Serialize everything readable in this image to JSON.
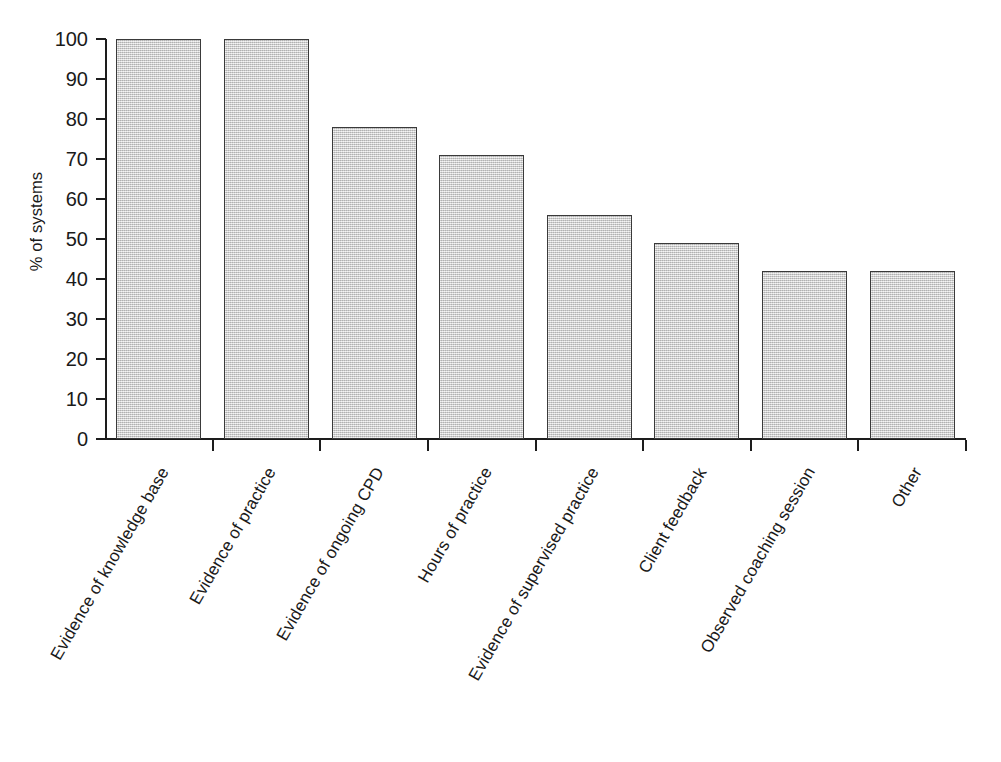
{
  "chart_data": {
    "type": "bar",
    "title": "",
    "xlabel": "",
    "ylabel": "% of systems",
    "ylim": [
      0,
      100
    ],
    "ytick_step": 10,
    "yticks": [
      100,
      90,
      80,
      70,
      60,
      50,
      40,
      30,
      20,
      10,
      0
    ],
    "grid": false,
    "legend": null,
    "categories": [
      "Evidence of knowledge base",
      "Evidence of practice",
      "Evidence of ongoing CPD",
      "Hours of practice",
      "Evidence of supervised practice",
      "Client feedback",
      "Observed coaching session",
      "Other"
    ],
    "values": [
      100,
      100,
      78,
      71,
      56,
      49,
      42,
      42
    ],
    "bar_fill_color": "#d2d2d2",
    "bar_edge_color": "#3a3a3a",
    "axis_color": "#1d1d1d",
    "background_color": "#ffffff"
  },
  "axis": {
    "y_label": "% of systems",
    "tick_labels": [
      "100",
      "90",
      "80",
      "70",
      "60",
      "50",
      "40",
      "30",
      "20",
      "10",
      "0"
    ]
  },
  "caption": {
    "text": ""
  }
}
